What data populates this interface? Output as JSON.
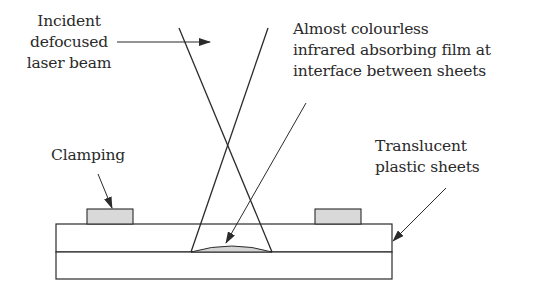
{
  "labels": {
    "incident": [
      "Incident",
      "defocused",
      "laser beam"
    ],
    "film": [
      "Almost colourless",
      "infrared absorbing film at",
      "interface between sheets"
    ],
    "clamping": "Clamping",
    "sheets": [
      "Translucent",
      "plastic sheets"
    ]
  },
  "colors": {
    "line": "#2b2b2b",
    "clamp_fill": "#d9d9d9",
    "film_fill": "#d4d4d4",
    "background": "#ffffff"
  }
}
